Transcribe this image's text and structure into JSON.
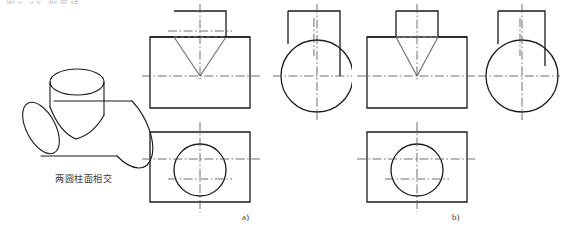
{
  "page": {
    "truncated_header_text": "图2-48  相贯线",
    "background_color": "#ffffff",
    "line_color": "#1a1a1a",
    "centerline_color": "#555555",
    "hidden_line_color": "#888888"
  },
  "pictorial": {
    "caption": "两圆柱面相交",
    "description": "isometric of horizontal cylinder pierced by vertical cylinder"
  },
  "figures": [
    {
      "id": "a",
      "label": "a)",
      "front_view": {
        "name": "front-view",
        "body_width": 100,
        "body_height": 62,
        "boss_width": 52,
        "boss_height": 26,
        "intersection_curve": "V-shaped two-branch intersection line reaching centerline"
      },
      "side_view": {
        "name": "side-view",
        "circle_diameter": 62,
        "boss_rect_width": 52,
        "boss_rect_height": 26
      },
      "top_view": {
        "name": "top-view",
        "rect_width": 100,
        "rect_height": 70,
        "circle_diameter": 52
      }
    },
    {
      "id": "b",
      "label": "b)",
      "front_view": {
        "name": "front-view",
        "body_width": 100,
        "body_height": 62,
        "boss_width": 42,
        "boss_height": 26,
        "intersection_curve": "V-shaped two-branch intersection line reaching centerline"
      },
      "side_view": {
        "name": "side-view",
        "circle_diameter": 62,
        "boss_rect_width": 42,
        "boss_rect_height": 26
      },
      "top_view": {
        "name": "top-view",
        "rect_width": 100,
        "rect_height": 70,
        "circle_diameter": 42
      }
    }
  ]
}
